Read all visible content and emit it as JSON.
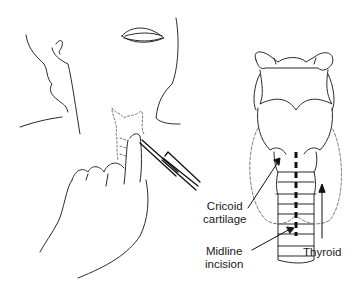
{
  "figure": {
    "panels": [
      {
        "name": "left-panel",
        "description": "Head tilted back, finger palpating cricoid, scalpel at neck"
      },
      {
        "name": "right-panel",
        "description": "Anterior view of larynx and trachea with thyroid outline"
      }
    ],
    "labels": {
      "cricoid_line1": "Cricoid",
      "cricoid_line2": "cartilage",
      "midline_line1": "Midline",
      "midline_line2": "incision",
      "thyroid": "Thyroid"
    },
    "colors": {
      "line": "#2a2a2a",
      "dashed": "#777777",
      "incision": "#111111",
      "background": "#ffffff"
    }
  }
}
